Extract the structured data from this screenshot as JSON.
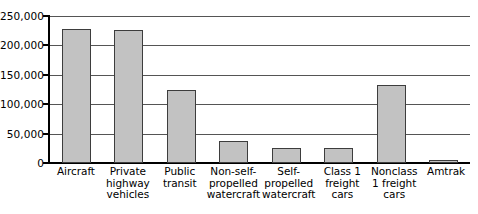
{
  "chart_data": {
    "type": "bar",
    "title": "",
    "subtitle": "",
    "xlabel": "",
    "ylabel": "",
    "ylim": [
      0,
      250000
    ],
    "grid": true,
    "legend": false,
    "legend_position": "none",
    "orientation": "vertical",
    "bar_color": "#c2c2c2",
    "bar_edge_color": "#3d3d3d",
    "axis_color": "#000000",
    "gridline_color": "#555555",
    "background_color": "#ffffff",
    "yticks": [
      0,
      50000,
      100000,
      150000,
      200000,
      250000
    ],
    "ytick_labels": [
      "0",
      "50,000",
      "100,000",
      "150,000",
      "200,000",
      "250,000"
    ],
    "categories": [
      "Aircraft",
      "Private highway vehicles",
      "Public transit",
      "Non-self-propelled watercraft",
      "Self-propelled watercraft",
      "Class 1 freight cars",
      "Nonclass 1 freight cars",
      "Amtrak"
    ],
    "category_label_lines": [
      [
        "Aircraft"
      ],
      [
        "Private",
        "highway",
        "vehicles"
      ],
      [
        "Public",
        "transit"
      ],
      [
        "Non-self-",
        "propelled",
        "watercraft"
      ],
      [
        "Self-",
        "propelled",
        "watercraft"
      ],
      [
        "Class 1",
        "freight",
        "cars"
      ],
      [
        "Nonclass",
        "1 freight",
        "cars"
      ],
      [
        "Amtrak"
      ]
    ],
    "values": [
      228000,
      227000,
      125000,
      38000,
      25000,
      25000,
      132000,
      5000
    ]
  }
}
